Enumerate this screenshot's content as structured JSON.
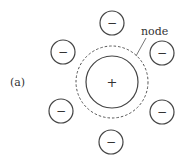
{
  "figure": {
    "panel_label": "(a)",
    "node_label": "node",
    "center_charge": "+",
    "ion_charge": "−",
    "colors": {
      "stroke": "#444444",
      "text": "#333333",
      "background": "#ffffff"
    },
    "central_ion": {
      "cx": 112,
      "cy": 82,
      "r": 26
    },
    "node_circle": {
      "cx": 112,
      "cy": 82,
      "r": 36,
      "style": "dashed"
    },
    "ions": [
      {
        "cx": 112,
        "cy": 23,
        "r": 12
      },
      {
        "cx": 63,
        "cy": 52,
        "r": 12
      },
      {
        "cx": 162,
        "cy": 53,
        "r": 12
      },
      {
        "cx": 61,
        "cy": 111,
        "r": 12
      },
      {
        "cx": 162,
        "cy": 112,
        "r": 12
      },
      {
        "cx": 111,
        "cy": 142,
        "r": 12
      }
    ]
  }
}
